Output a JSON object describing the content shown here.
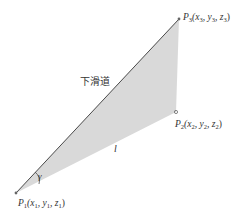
{
  "diagram": {
    "colors": {
      "fill": "#d9d9d9",
      "line": "#4a4a4a",
      "text": "#333333",
      "point": "#666666"
    },
    "glide_path_label": "下滑道",
    "angle_label": "γ",
    "length_label": "l",
    "points": {
      "p1": {
        "name": "P",
        "sub": "1",
        "coords": "(x",
        "x_sub": "1",
        "y": ", y",
        "y_sub": "1",
        "z": ", z",
        "z_sub": "1",
        "close": ")"
      },
      "p2": {
        "name": "P",
        "sub": "2",
        "coords": "(x",
        "x_sub": "2",
        "y": ", y",
        "y_sub": "2",
        "z": ", z",
        "z_sub": "2",
        "close": ")"
      },
      "p3": {
        "name": "P",
        "sub": "3",
        "coords": "(x",
        "x_sub": "3",
        "y": ", y",
        "y_sub": "3",
        "z": ", z",
        "z_sub": "3",
        "close": ")"
      }
    }
  }
}
